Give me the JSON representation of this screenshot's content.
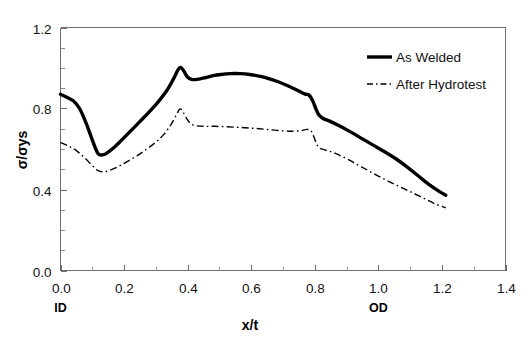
{
  "chart_data": {
    "type": "line",
    "title": "",
    "xlabel": "x/t",
    "ylabel": "σ/σys",
    "xlim": [
      0.0,
      1.4
    ],
    "ylim": [
      0.0,
      1.2
    ],
    "grid": false,
    "legend_position": "top-right",
    "xticks": [
      "0.0",
      "0.2",
      "0.4",
      "0.6",
      "0.8",
      "1.0",
      "1.2",
      "1.4"
    ],
    "xtick_values": [
      0.0,
      0.2,
      0.4,
      0.6,
      0.8,
      1.0,
      1.2,
      1.4
    ],
    "yticks": [
      "0.0",
      "0.4",
      "0.8",
      "1.2"
    ],
    "ytick_values": [
      0.0,
      0.4,
      0.8,
      1.2
    ],
    "x_minor_interval": 0.1,
    "y_minor_interval": 0.1,
    "annotations": [
      {
        "text": "ID",
        "x": 0.0,
        "position": "below-axis"
      },
      {
        "text": "OD",
        "x": 1.0,
        "position": "below-axis"
      }
    ],
    "series": [
      {
        "name": "As Welded",
        "style": "solid",
        "color": "#000000",
        "linewidth": 3.4,
        "points": [
          [
            0.0,
            0.87
          ],
          [
            0.02,
            0.855
          ],
          [
            0.04,
            0.838
          ],
          [
            0.06,
            0.8
          ],
          [
            0.08,
            0.73
          ],
          [
            0.1,
            0.645
          ],
          [
            0.118,
            0.578
          ],
          [
            0.135,
            0.572
          ],
          [
            0.15,
            0.585
          ],
          [
            0.17,
            0.61
          ],
          [
            0.19,
            0.64
          ],
          [
            0.21,
            0.672
          ],
          [
            0.235,
            0.712
          ],
          [
            0.26,
            0.752
          ],
          [
            0.285,
            0.793
          ],
          [
            0.31,
            0.838
          ],
          [
            0.335,
            0.89
          ],
          [
            0.355,
            0.945
          ],
          [
            0.37,
            0.992
          ],
          [
            0.378,
            1.003
          ],
          [
            0.388,
            0.985
          ],
          [
            0.398,
            0.958
          ],
          [
            0.412,
            0.944
          ],
          [
            0.43,
            0.944
          ],
          [
            0.455,
            0.952
          ],
          [
            0.48,
            0.962
          ],
          [
            0.505,
            0.968
          ],
          [
            0.535,
            0.972
          ],
          [
            0.565,
            0.972
          ],
          [
            0.595,
            0.968
          ],
          [
            0.625,
            0.96
          ],
          [
            0.655,
            0.948
          ],
          [
            0.685,
            0.932
          ],
          [
            0.715,
            0.912
          ],
          [
            0.745,
            0.89
          ],
          [
            0.768,
            0.872
          ],
          [
            0.782,
            0.866
          ],
          [
            0.793,
            0.84
          ],
          [
            0.803,
            0.8
          ],
          [
            0.812,
            0.77
          ],
          [
            0.825,
            0.752
          ],
          [
            0.85,
            0.735
          ],
          [
            0.88,
            0.712
          ],
          [
            0.915,
            0.682
          ],
          [
            0.95,
            0.65
          ],
          [
            0.985,
            0.618
          ],
          [
            1.02,
            0.586
          ],
          [
            1.055,
            0.552
          ],
          [
            1.09,
            0.512
          ],
          [
            1.125,
            0.468
          ],
          [
            1.16,
            0.424
          ],
          [
            1.19,
            0.392
          ],
          [
            1.212,
            0.372
          ]
        ]
      },
      {
        "name": "After Hydrotest",
        "style": "dash-dot",
        "color": "#000000",
        "linewidth": 1.4,
        "points": [
          [
            0.0,
            0.632
          ],
          [
            0.025,
            0.615
          ],
          [
            0.05,
            0.592
          ],
          [
            0.075,
            0.558
          ],
          [
            0.1,
            0.518
          ],
          [
            0.12,
            0.492
          ],
          [
            0.14,
            0.488
          ],
          [
            0.16,
            0.498
          ],
          [
            0.185,
            0.516
          ],
          [
            0.21,
            0.538
          ],
          [
            0.24,
            0.566
          ],
          [
            0.27,
            0.598
          ],
          [
            0.3,
            0.634
          ],
          [
            0.325,
            0.672
          ],
          [
            0.348,
            0.722
          ],
          [
            0.365,
            0.77
          ],
          [
            0.376,
            0.798
          ],
          [
            0.386,
            0.782
          ],
          [
            0.398,
            0.748
          ],
          [
            0.412,
            0.722
          ],
          [
            0.43,
            0.714
          ],
          [
            0.455,
            0.712
          ],
          [
            0.485,
            0.712
          ],
          [
            0.52,
            0.71
          ],
          [
            0.56,
            0.707
          ],
          [
            0.6,
            0.703
          ],
          [
            0.64,
            0.698
          ],
          [
            0.68,
            0.692
          ],
          [
            0.72,
            0.688
          ],
          [
            0.755,
            0.69
          ],
          [
            0.775,
            0.697
          ],
          [
            0.788,
            0.69
          ],
          [
            0.797,
            0.66
          ],
          [
            0.806,
            0.624
          ],
          [
            0.815,
            0.605
          ],
          [
            0.835,
            0.594
          ],
          [
            0.865,
            0.578
          ],
          [
            0.9,
            0.552
          ],
          [
            0.935,
            0.522
          ],
          [
            0.97,
            0.492
          ],
          [
            1.005,
            0.462
          ],
          [
            1.04,
            0.434
          ],
          [
            1.075,
            0.408
          ],
          [
            1.11,
            0.382
          ],
          [
            1.145,
            0.355
          ],
          [
            1.18,
            0.328
          ],
          [
            1.212,
            0.31
          ]
        ]
      }
    ]
  },
  "legend": {
    "items": [
      {
        "label": "As Welded",
        "style": "solid"
      },
      {
        "label": "After Hydrotest",
        "style": "dash-dot"
      }
    ]
  }
}
